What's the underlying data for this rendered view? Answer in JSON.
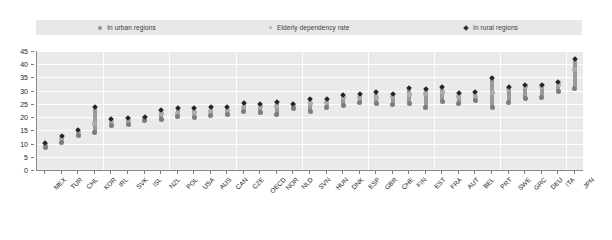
{
  "legend": {
    "items": [
      {
        "label": "In urban regions",
        "marker": "circle-icon",
        "color": "#8f8f8f"
      },
      {
        "label": "Elderly dependency rate",
        "marker": "circle-icon",
        "color": "#b4b4b4"
      },
      {
        "label": "In rural regions",
        "marker": "diamond-icon",
        "color": "#2e2e2e"
      }
    ],
    "background": "#e8e8e8"
  },
  "chart_data": {
    "type": "scatter",
    "title": "",
    "subtitle": "",
    "xlabel": "",
    "ylabel": "",
    "ylim": [
      0,
      45
    ],
    "yticks": [
      0,
      5,
      10,
      15,
      20,
      25,
      30,
      35,
      40,
      45
    ],
    "grid": true,
    "legend_position": "top",
    "categories": [
      "MEX",
      "TUR",
      "CHL",
      "KOR",
      "IRL",
      "SVK",
      "ISL",
      "NZL",
      "POL",
      "USA",
      "AUS",
      "CAN",
      "CZE",
      "OECD",
      "NOR",
      "NLD",
      "SVN",
      "HUN",
      "DNK",
      "ESP",
      "GBR",
      "CHE",
      "FIN",
      "EST",
      "FRA",
      "AUT",
      "BEL",
      "PRT",
      "SWE",
      "GRC",
      "DEU",
      "ITA",
      "JPN"
    ],
    "series": [
      {
        "name": "Elderly dependency rate",
        "type": "point",
        "color": "#adadad",
        "values": [
          9.8,
          12.0,
          14.3,
          17.5,
          18.3,
          18.7,
          19.4,
          21.3,
          21.5,
          21.8,
          22.1,
          22.5,
          23.6,
          23.9,
          24.2,
          24.5,
          25.3,
          25.6,
          27.4,
          27.5,
          27.6,
          27.8,
          28.5,
          28.9,
          29.4,
          27.8,
          27.9,
          29.4,
          30.7,
          31.4,
          31.6,
          32.5,
          38.0
        ]
      },
      {
        "name": "In urban regions",
        "type": "range-low",
        "color": "#9a9a9a",
        "values": [
          8.6,
          10.4,
          13.1,
          14.0,
          17.0,
          17.2,
          18.8,
          19.0,
          20.2,
          20.0,
          20.5,
          21.0,
          22.0,
          21.6,
          20.8,
          23.4,
          22.0,
          23.8,
          24.3,
          25.4,
          25.0,
          24.8,
          25.3,
          23.8,
          25.8,
          25.0,
          26.1,
          23.5,
          25.5,
          27.0,
          27.6,
          29.6,
          31.0
        ]
      },
      {
        "name": "In rural regions",
        "type": "range-high",
        "color": "#242424",
        "values": [
          10.3,
          13.0,
          15.0,
          23.7,
          19.1,
          19.5,
          19.9,
          22.6,
          23.3,
          23.3,
          24.0,
          23.7,
          25.4,
          25.0,
          25.8,
          25.0,
          27.0,
          26.9,
          28.4,
          28.9,
          29.4,
          28.6,
          30.9,
          30.5,
          31.4,
          29.0,
          29.4,
          34.7,
          31.5,
          32.0,
          32.3,
          33.3,
          42.0
        ]
      }
    ]
  }
}
